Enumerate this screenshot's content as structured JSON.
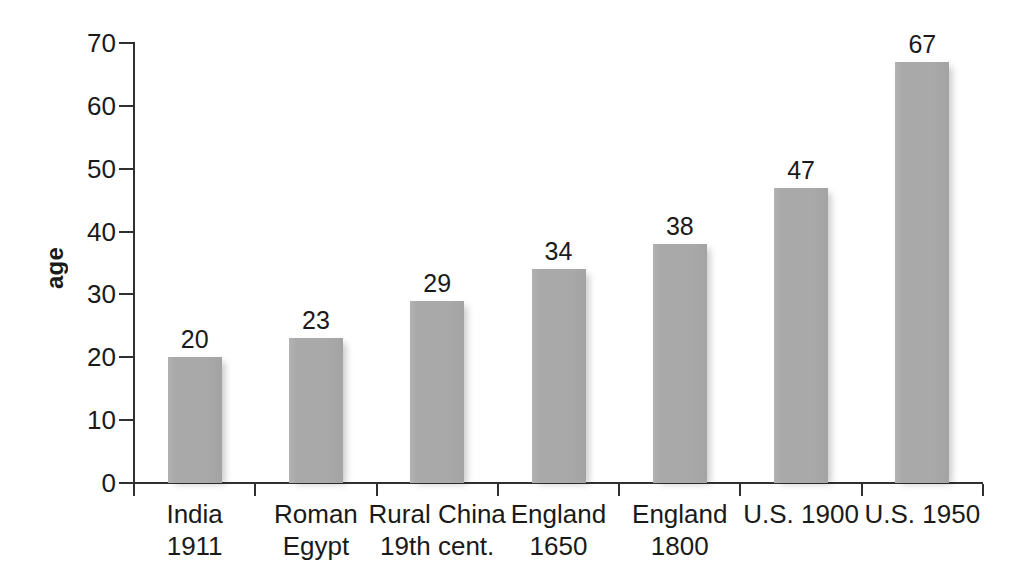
{
  "chart_data": {
    "type": "bar",
    "title": "",
    "xlabel": "",
    "ylabel": "age",
    "ylim": [
      0,
      70
    ],
    "yticks": [
      0,
      10,
      20,
      30,
      40,
      50,
      60,
      70
    ],
    "grid": false,
    "legend": null,
    "bar_color": "#a9a9a9",
    "categories": [
      "India\n1911",
      "Roman\nEgypt",
      "Rural China\n19th cent.",
      "England\n1650",
      "England\n1800",
      "U.S. 1900",
      "U.S. 1950"
    ],
    "values": [
      20,
      23,
      29,
      34,
      38,
      47,
      67
    ],
    "value_labels": [
      "20",
      "23",
      "29",
      "34",
      "38",
      "47",
      "67"
    ],
    "ytick_labels": [
      "0",
      "10",
      "20",
      "30",
      "40",
      "50",
      "60",
      "70"
    ]
  }
}
